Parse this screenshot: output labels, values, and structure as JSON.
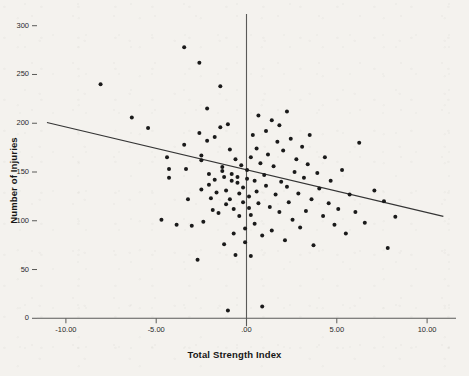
{
  "chart_data": {
    "type": "scatter",
    "title": "",
    "xlabel": "Total Strength Index",
    "ylabel": "Number of Injuries",
    "xlim": [
      -11.6,
      11.6
    ],
    "ylim": [
      -12,
      312
    ],
    "xticks": [
      -10,
      -5,
      0,
      5,
      10
    ],
    "xtick_labels": [
      "-10.00",
      "-5.00",
      ".00",
      "5.00",
      "10.00"
    ],
    "yticks": [
      0,
      50,
      100,
      150,
      200,
      250,
      300
    ],
    "ytick_labels": [
      "0",
      "50",
      "100",
      "150",
      "200",
      "250",
      "300"
    ],
    "grid": false,
    "legend": null,
    "marker_color": "#1a1a1a",
    "marker_size": 3.1,
    "axis_color": "#5a5a58",
    "background_color": "#f4f2ee",
    "zero_vline": true,
    "fit_line": {
      "kind": "linear-regression",
      "color": "#343434",
      "x_start": -11.05,
      "y_start": 200.7,
      "x_end": 10.9,
      "y_end": 104.5,
      "slope": -4.38,
      "intercept": 152.3
    },
    "points": [
      [
        -8.08,
        240
      ],
      [
        -6.35,
        206
      ],
      [
        -5.45,
        195
      ],
      [
        -4.4,
        165
      ],
      [
        -4.29,
        153
      ],
      [
        -4.29,
        144
      ],
      [
        -3.45,
        278
      ],
      [
        -3.45,
        178
      ],
      [
        -3.35,
        153
      ],
      [
        -3.24,
        122
      ],
      [
        -3.03,
        95
      ],
      [
        -2.61,
        262
      ],
      [
        -2.61,
        190
      ],
      [
        -2.5,
        167
      ],
      [
        -2.5,
        162
      ],
      [
        -2.5,
        132
      ],
      [
        -2.39,
        99
      ],
      [
        -2.18,
        215
      ],
      [
        -2.18,
        182
      ],
      [
        -2.08,
        148
      ],
      [
        -2.08,
        137
      ],
      [
        -1.97,
        123
      ],
      [
        -1.87,
        111
      ],
      [
        -1.76,
        186
      ],
      [
        -1.76,
        142
      ],
      [
        -1.66,
        129
      ],
      [
        -1.55,
        108
      ],
      [
        -1.45,
        238
      ],
      [
        -1.45,
        196
      ],
      [
        -1.34,
        155
      ],
      [
        -1.34,
        151
      ],
      [
        -1.24,
        145
      ],
      [
        -1.13,
        131
      ],
      [
        -1.13,
        117
      ],
      [
        -1.03,
        199
      ],
      [
        -0.92,
        173
      ],
      [
        -0.92,
        122
      ],
      [
        -0.82,
        148
      ],
      [
        -0.82,
        141
      ],
      [
        -0.71,
        112
      ],
      [
        -0.71,
        87
      ],
      [
        -0.61,
        163
      ],
      [
        -0.5,
        145
      ],
      [
        -0.5,
        139
      ],
      [
        -0.4,
        128
      ],
      [
        -0.4,
        105
      ],
      [
        -0.29,
        157
      ],
      [
        -0.19,
        134
      ],
      [
        -0.19,
        119
      ],
      [
        -0.08,
        92
      ],
      [
        -0.08,
        78
      ],
      [
        0.03,
        152
      ],
      [
        0.03,
        143
      ],
      [
        0.14,
        125
      ],
      [
        0.14,
        113
      ],
      [
        0.24,
        165
      ],
      [
        0.24,
        106
      ],
      [
        0.35,
        188
      ],
      [
        0.45,
        141
      ],
      [
        0.45,
        97
      ],
      [
        0.56,
        174
      ],
      [
        0.56,
        130
      ],
      [
        0.66,
        208
      ],
      [
        0.66,
        118
      ],
      [
        0.77,
        159
      ],
      [
        0.87,
        85
      ],
      [
        0.87,
        12
      ],
      [
        0.98,
        147
      ],
      [
        1.08,
        192
      ],
      [
        1.08,
        136
      ],
      [
        1.19,
        168
      ],
      [
        1.29,
        114
      ],
      [
        1.4,
        203
      ],
      [
        1.4,
        90
      ],
      [
        1.5,
        156
      ],
      [
        1.61,
        127
      ],
      [
        1.71,
        181
      ],
      [
        1.82,
        198
      ],
      [
        1.82,
        109
      ],
      [
        1.92,
        140
      ],
      [
        2.03,
        172
      ],
      [
        2.13,
        80
      ],
      [
        2.24,
        212
      ],
      [
        2.24,
        135
      ],
      [
        2.34,
        119
      ],
      [
        2.45,
        184
      ],
      [
        2.55,
        101
      ],
      [
        2.66,
        150
      ],
      [
        2.76,
        163
      ],
      [
        2.87,
        128
      ],
      [
        2.97,
        93
      ],
      [
        3.08,
        176
      ],
      [
        3.18,
        144
      ],
      [
        3.29,
        110
      ],
      [
        3.39,
        158
      ],
      [
        3.5,
        188
      ],
      [
        3.6,
        122
      ],
      [
        3.71,
        75
      ],
      [
        3.92,
        149
      ],
      [
        4.03,
        133
      ],
      [
        4.24,
        105
      ],
      [
        4.34,
        165
      ],
      [
        4.55,
        118
      ],
      [
        4.66,
        141
      ],
      [
        4.87,
        96
      ],
      [
        5.08,
        112
      ],
      [
        5.29,
        152
      ],
      [
        5.5,
        87
      ],
      [
        5.71,
        127
      ],
      [
        6.03,
        109
      ],
      [
        6.24,
        180
      ],
      [
        6.55,
        98
      ],
      [
        7.08,
        131
      ],
      [
        7.61,
        120
      ],
      [
        7.82,
        72
      ],
      [
        8.24,
        104
      ],
      [
        -4.71,
        101
      ],
      [
        -3.87,
        96
      ],
      [
        -1.24,
        76
      ],
      [
        -0.61,
        65
      ],
      [
        0.24,
        64
      ],
      [
        -2.71,
        60
      ],
      [
        -1.03,
        8
      ]
    ]
  }
}
